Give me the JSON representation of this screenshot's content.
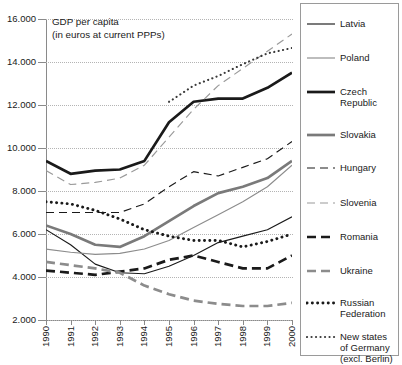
{
  "chart_data": {
    "type": "line",
    "title": "GDP per capita\n(in euros at current PPPs)",
    "xlabel": "",
    "ylabel": "",
    "grid": true,
    "legend_position": "right",
    "x": [
      1990,
      1991,
      1992,
      1993,
      1994,
      1995,
      1996,
      1997,
      1998,
      1999,
      2000
    ],
    "xtick_labels": [
      "1990",
      "1991",
      "1992",
      "1993",
      "1994",
      "1995",
      "1996",
      "1997",
      "1998",
      "1999",
      "2000"
    ],
    "ytick_labels": [
      "16.000",
      "14.000",
      "12.000",
      "10.000",
      "8.000",
      "6.000",
      "4.000",
      "2.000"
    ],
    "ytick_values": [
      16000,
      14000,
      12000,
      10000,
      8000,
      6000,
      4000,
      2000
    ],
    "ylim": [
      2000,
      16000
    ],
    "xlim": [
      1990,
      2000
    ],
    "series": [
      {
        "name": "Latvia",
        "style": "solid",
        "width": "thin",
        "color": "#1a1a1a",
        "values": [
          6200,
          5500,
          4600,
          4200,
          4150,
          4500,
          5000,
          5600,
          5900,
          6200,
          6800
        ]
      },
      {
        "name": "Poland",
        "style": "solid",
        "width": "thin",
        "color": "#8c8c8c",
        "values": [
          5300,
          5150,
          5050,
          5100,
          5300,
          5700,
          6300,
          6900,
          7500,
          8200,
          9200
        ]
      },
      {
        "name": "Czech\nRepublic",
        "style": "solid",
        "width": "thick",
        "color": "#1a1a1a",
        "values": [
          9400,
          8800,
          8950,
          9000,
          9400,
          11200,
          12150,
          12300,
          12300,
          12800,
          13500
        ]
      },
      {
        "name": "Slovakia",
        "style": "solid",
        "width": "thick",
        "color": "#7a7a7a",
        "values": [
          6400,
          6000,
          5500,
          5400,
          5900,
          6600,
          7300,
          7900,
          8200,
          8600,
          9400
        ]
      },
      {
        "name": "Hungary",
        "style": "dashed",
        "width": "thin",
        "color": "#1a1a1a",
        "values": [
          7000,
          7000,
          7000,
          7000,
          7400,
          8200,
          8900,
          8700,
          9100,
          9500,
          10300
        ]
      },
      {
        "name": "Slovenia",
        "style": "dashed",
        "width": "thin",
        "color": "#9a9a9a",
        "values": [
          8950,
          8300,
          8400,
          8600,
          9200,
          10500,
          11800,
          12900,
          13700,
          14500,
          15300
        ]
      },
      {
        "name": "Romania",
        "style": "dashed",
        "width": "thick",
        "color": "#1a1a1a",
        "values": [
          4300,
          4200,
          4100,
          4250,
          4400,
          4800,
          5000,
          4700,
          4400,
          4400,
          5000
        ]
      },
      {
        "name": "Ukraine",
        "style": "dashed",
        "width": "thick",
        "color": "#8c8c8c",
        "values": [
          4700,
          4550,
          4400,
          4200,
          3600,
          3200,
          2900,
          2750,
          2650,
          2650,
          2800
        ]
      },
      {
        "name": "Russian\nFederation",
        "style": "dotted",
        "width": "thick",
        "color": "#1a1a1a",
        "values": [
          7500,
          7400,
          7100,
          6700,
          6200,
          5900,
          5700,
          5700,
          5400,
          5650,
          6000
        ]
      },
      {
        "name": "New states\nof Germany\n(excl. Berlin)",
        "style": "dotted",
        "width": "thin",
        "color": "#3a3a3a",
        "values": [
          null,
          null,
          null,
          null,
          null,
          12150,
          12900,
          13350,
          13900,
          14400,
          14650
        ]
      }
    ]
  },
  "legend": {
    "items": [
      {
        "label": "Latvia"
      },
      {
        "label": "Poland"
      },
      {
        "label": "Czech\nRepublic"
      },
      {
        "label": "Slovakia"
      },
      {
        "label": "Hungary"
      },
      {
        "label": "Slovenia"
      },
      {
        "label": "Romania"
      },
      {
        "label": "Ukraine"
      },
      {
        "label": "Russian\nFederation"
      },
      {
        "label": "New states\nof Germany\n(excl. Berlin)"
      }
    ]
  }
}
